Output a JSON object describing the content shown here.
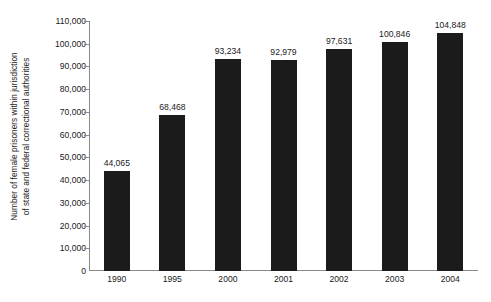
{
  "chart_data": {
    "type": "bar",
    "title": "",
    "subtitle": "",
    "xlabel": "",
    "ylabel_line1": "Number of female prisoners within jurisdiction",
    "ylabel_line2": "of state and federal correctional authorities",
    "categories": [
      "1990",
      "1995",
      "2000",
      "2001",
      "2002",
      "2003",
      "2004"
    ],
    "values": [
      44065,
      68468,
      93234,
      92979,
      97631,
      100846,
      104848
    ],
    "value_labels": [
      "44,065",
      "68,468",
      "93,234",
      "92,979",
      "97,631",
      "100,846",
      "104,848"
    ],
    "ylim": [
      0,
      110000
    ],
    "ytick_values": [
      0,
      10000,
      20000,
      30000,
      40000,
      50000,
      60000,
      70000,
      80000,
      90000,
      100000,
      110000
    ],
    "ytick_labels": [
      "0",
      "10,000",
      "20,000",
      "30,000",
      "40,000",
      "50,000",
      "60,000",
      "70,000",
      "80,000",
      "90,000",
      "100,000",
      "110,000"
    ],
    "grid": false,
    "legend": null,
    "bar_color": "#1b1b1b",
    "axis_color": "#8a8a8a",
    "background_color": "#ffffff",
    "text_color": "#1a1a1a"
  }
}
